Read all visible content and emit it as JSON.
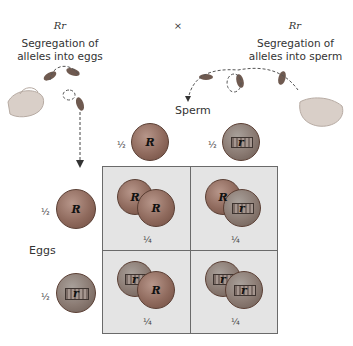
{
  "parents": {
    "female": {
      "genotype": "Rr",
      "caption_line1": "Segregation of",
      "caption_line2": "alleles into eggs"
    },
    "cross_symbol": "×",
    "male": {
      "genotype": "Rr",
      "caption_line1": "Segregation of",
      "caption_line2": "alleles into sperm"
    }
  },
  "axis_labels": {
    "sperm": "Sperm",
    "eggs": "Eggs"
  },
  "sperm": [
    {
      "allele": "R",
      "probability": "½",
      "coin": "penny-heads"
    },
    {
      "allele": "r",
      "probability": "½",
      "coin": "penny-tails"
    }
  ],
  "eggs": [
    {
      "allele": "R",
      "probability": "½",
      "coin": "penny-heads"
    },
    {
      "allele": "r",
      "probability": "½",
      "coin": "penny-tails"
    }
  ],
  "punnett": {
    "cells": [
      {
        "alleles": [
          "R",
          "R"
        ],
        "probability": "¼"
      },
      {
        "alleles": [
          "R",
          "r"
        ],
        "probability": "¼"
      },
      {
        "alleles": [
          "r",
          "R"
        ],
        "probability": "¼"
      },
      {
        "alleles": [
          "r",
          "r"
        ],
        "probability": "¼"
      }
    ]
  },
  "colors": {
    "grid_bg": "#e4e4e4",
    "grid_border": "#6a6a6a",
    "penny_heads": "#8f6a5d",
    "penny_tails": "#8a7a72"
  }
}
